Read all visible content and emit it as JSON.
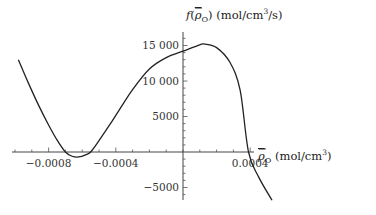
{
  "chart_data": {
    "type": "line",
    "title": "",
    "ylabel": "f(ρ̄_O) (mol/cm³/s)",
    "xlabel": "ρ̄_O (mol/cm³)",
    "ylabel_parts": {
      "func": "f",
      "open": "(",
      "sym": "ρ",
      "sub": "O",
      "close": ")",
      "unit": " (mol/cm",
      "sup": "3",
      "unit_end": "/s)"
    },
    "xlabel_parts": {
      "sym": "ρ",
      "sub": "O",
      "unit": " (mol/cm",
      "sup": "3",
      "unit_end": ")"
    },
    "xlim": [
      -0.00102,
      0.00055
    ],
    "ylim": [
      -7000,
      16500
    ],
    "x_ticks": [
      -0.0008,
      -0.0004,
      0.0004
    ],
    "x_tick_labels": [
      "−0.0008",
      "−0.0004",
      "0.0004"
    ],
    "x_minor_step": 0.0001,
    "y_ticks": [
      15000,
      10000,
      5000,
      -5000
    ],
    "y_tick_labels": [
      "15 000",
      "10 000",
      "5000",
      "−5000"
    ],
    "y_minor_step": 1000,
    "grid": false,
    "legend": null,
    "series": [
      {
        "name": "f(ρ̄_O)",
        "color": "#222222",
        "x": [
          -0.00098,
          -0.00092,
          -0.00086,
          -0.0008,
          -0.00075,
          -0.0007,
          -0.00066,
          -0.00062,
          -0.00058,
          -0.00055,
          -0.0005,
          -0.00044,
          -0.00038,
          -0.0003,
          -0.0002,
          -0.0001,
          0.0,
          0.0001,
          0.00013,
          0.0002,
          0.00028,
          0.00034,
          0.00039,
          0.00045,
          0.00053
        ],
        "values": [
          13000,
          9700,
          6600,
          3800,
          1700,
          0,
          -600,
          -700,
          -400,
          0,
          1600,
          3700,
          5900,
          8800,
          11700,
          13300,
          14200,
          15100,
          15200,
          14700,
          12600,
          8700,
          0,
          -3500,
          -6800
        ]
      }
    ]
  }
}
